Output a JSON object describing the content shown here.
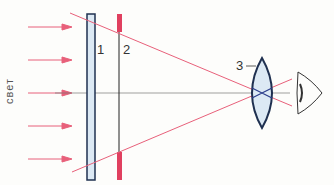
{
  "diagram": {
    "light_label": "свет",
    "labels": {
      "plate": "1",
      "aperture": "2",
      "lens": "3"
    },
    "colors": {
      "ray": "#e8607a",
      "arrow": "#e8607a",
      "outline": "#1f3050",
      "glass": "#dce9f4",
      "stop": "#e0405f",
      "axis": "#555555"
    },
    "arrows_y": [
      27,
      60,
      93,
      126,
      159
    ]
  }
}
